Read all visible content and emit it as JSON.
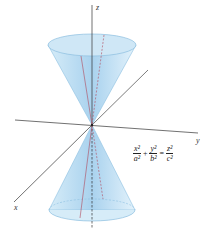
{
  "diagram": {
    "type": "double-cone",
    "axes": {
      "x_label": "x",
      "y_label": "y",
      "z_label": "z"
    },
    "equation": {
      "terms": [
        {
          "num": "x²",
          "den": "a²"
        },
        {
          "num": "y²",
          "den": "b²"
        },
        {
          "num": "z²",
          "den": "c²"
        }
      ],
      "plus": "+",
      "equals": "="
    },
    "colors": {
      "cone_fill": "#bfe0f4",
      "cone_edge": "#7fb6d9",
      "axis": "#333333",
      "generator_line": "#b0485a"
    }
  }
}
